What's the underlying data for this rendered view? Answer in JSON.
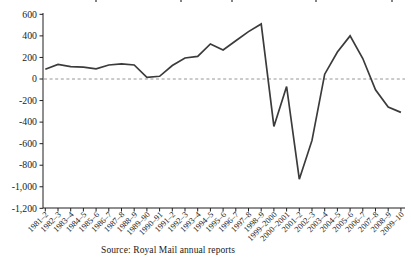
{
  "chart_data": {
    "type": "line",
    "categories": [
      "1981–2",
      "1982–3",
      "1983–4",
      "1984–5",
      "1985–6",
      "1986–7",
      "1987–8",
      "1988–9",
      "1989–90",
      "1990–91",
      "1991–2",
      "1992–3",
      "1993–4",
      "1994–5",
      "1995–6",
      "1996–7",
      "1997–8",
      "1998–9",
      "1999–2000",
      "2000–2001",
      "2001–2",
      "2002–3",
      "2003–4",
      "2004–5",
      "2005–6",
      "2006–7",
      "2007–8",
      "2008–9",
      "2009–10"
    ],
    "values": [
      90,
      135,
      115,
      110,
      95,
      130,
      140,
      130,
      15,
      25,
      125,
      195,
      210,
      325,
      270,
      355,
      440,
      510,
      -440,
      -70,
      -930,
      -570,
      45,
      250,
      400,
      190,
      -100,
      -260,
      -310
    ],
    "ylim": [
      -1200,
      600
    ],
    "y_ticks": [
      600,
      400,
      200,
      0,
      -200,
      -400,
      -600,
      -800,
      -1000,
      -1200
    ],
    "y_tick_labels": [
      "600",
      "400",
      "200",
      "0",
      "-200",
      "-400",
      "-600",
      "-800",
      "-1,000",
      "-1,200"
    ],
    "zero_line_style": "dashed",
    "grid": false,
    "legend": "none",
    "source": "Source: Royal Mail annual reports",
    "colors": {
      "line": "#3b3b3b",
      "axis": "#1f1f1f",
      "zero_line": "#8a8a8a",
      "text": "#1a1a1a"
    }
  }
}
